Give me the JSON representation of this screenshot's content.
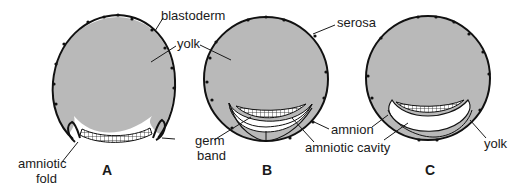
{
  "figure": {
    "type": "embryology diagram",
    "panels": [
      {
        "id": "A",
        "label": "A",
        "labels": {
          "blastoderm": "blastoderm",
          "yolk": "yolk",
          "germ_band": "germ band",
          "amniotic_fold": "amniotic fold"
        }
      },
      {
        "id": "B",
        "label": "B",
        "labels": {
          "serosa": "serosa",
          "yolk": "yolk",
          "amnion": "amnion",
          "amniotic_cavity": "amniotic cavity",
          "germ_band": "germ band"
        }
      },
      {
        "id": "C",
        "label": "C",
        "labels": {
          "serosa": "serosa",
          "amnion": "amnion",
          "amniotic_cavity": "amniotic cavity",
          "yolk": "yolk"
        }
      }
    ],
    "text": {
      "blastoderm": "blastoderm",
      "yolk_a": "yolk",
      "yolk_b": "yolk",
      "yolk_c": "yolk",
      "serosa": "serosa",
      "germ": "germ",
      "band": "band",
      "amnion": "amnion",
      "amniotic_cavity": "amniotic cavity",
      "amniotic": "amniotic",
      "fold": "fold",
      "panel_a": "A",
      "panel_b": "B",
      "panel_c": "C"
    },
    "colors": {
      "yolk_fill": "#b9b9b9",
      "outline": "#111111",
      "background": "#ffffff"
    }
  }
}
